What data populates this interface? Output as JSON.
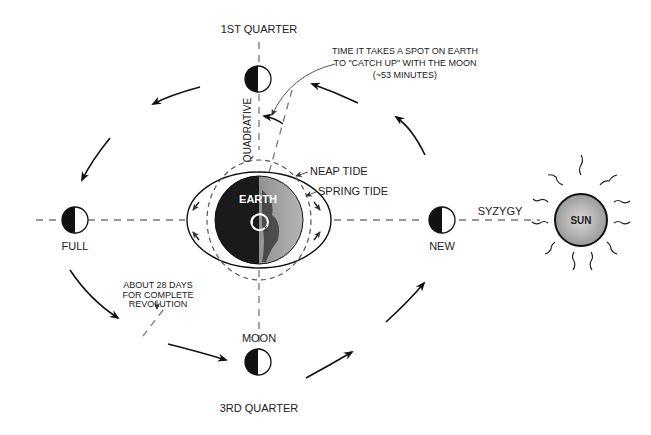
{
  "labels": {
    "first_quarter": "1ST QUARTER",
    "third_quarter": "3RD QUARTER",
    "full": "FULL",
    "new": "NEW",
    "moon": "MOON",
    "earth": "EARTH",
    "sun": "SUN",
    "syzygy": "SYZYGY",
    "quadrative": "QUADRATIVE",
    "neap_tide": "NEAP TIDE",
    "spring_tide": "SPRING TIDE"
  },
  "annotations": {
    "catch_up_line1": "TIME IT TAKES A SPOT ON EARTH",
    "catch_up_line2": "TO \"CATCH UP\" WITH THE MOON",
    "catch_up_line3": "(~53 MINUTES)",
    "revolution_line1": "ABOUT 28 DAYS",
    "revolution_line2": "FOR COMPLETE",
    "revolution_line3": "REVOLUTION"
  },
  "colors": {
    "ink": "#111111",
    "dash": "#777777",
    "earth_dark": "#1a1a1a",
    "earth_light": "#8a8a8a",
    "sun_fill": "#b0b0b0"
  }
}
